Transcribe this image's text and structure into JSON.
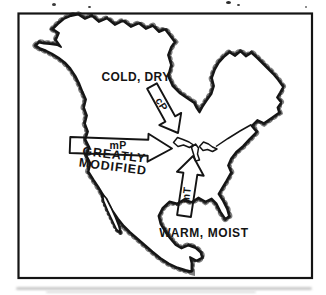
{
  "figure": {
    "region_labels": {
      "cold_dry": "COLD, DRY",
      "warm_moist": "WARM, MOIST",
      "greatly_modified_line1": "GREATLY",
      "greatly_modified_line2": "MODIFIED"
    },
    "air_mass_labels": {
      "cp": "cP",
      "mp": "mP",
      "mt": "mT"
    },
    "colors": {
      "ink": "#141414",
      "paper": "#ffffff"
    }
  }
}
